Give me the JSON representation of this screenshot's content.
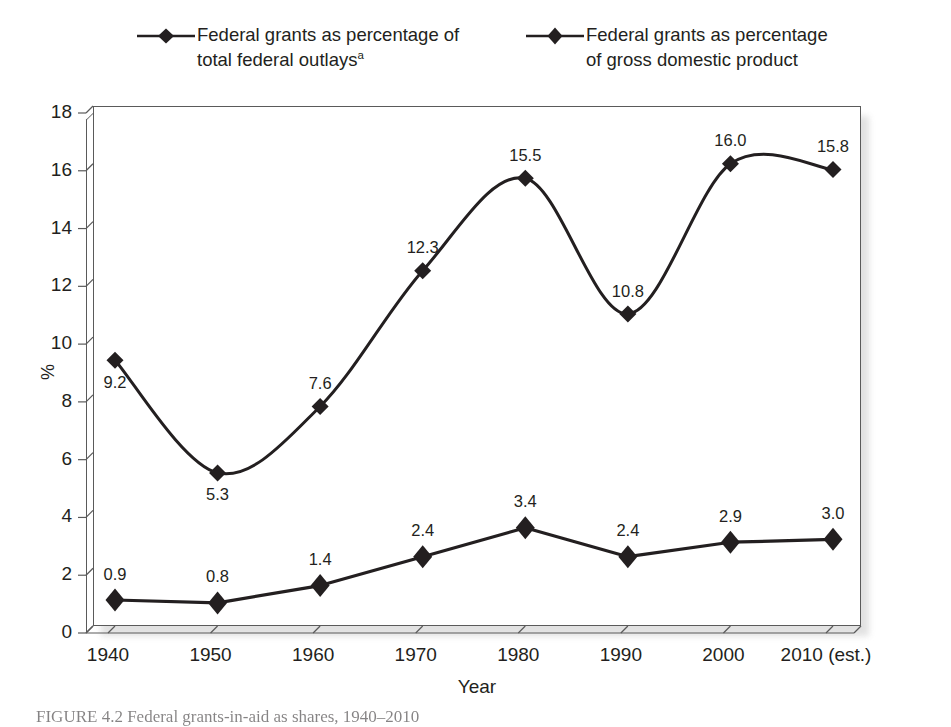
{
  "legend": {
    "entries": [
      {
        "label": "Federal grants as percentage of\ntotal federal outlays",
        "note": "a",
        "marker": "diamond-marker-icon"
      },
      {
        "label": "Federal grants as percentage\nof gross domestic product",
        "note": "",
        "marker": "diamond-marker-icon"
      }
    ]
  },
  "caption": {
    "text": "FIGURE 4.2   Federal grants-in-aid as shares, 1940–2010"
  },
  "chart_data": {
    "type": "line",
    "title": "",
    "xlabel": "Year",
    "ylabel": "%",
    "categories": [
      "1940",
      "1950",
      "1960",
      "1970",
      "1980",
      "1990",
      "2000",
      "2010 (est.)"
    ],
    "x_values": [
      1940,
      1950,
      1960,
      1970,
      1980,
      1990,
      2000,
      2010
    ],
    "ylim": [
      0,
      18
    ],
    "yticks": [
      "0",
      "2",
      "4",
      "6",
      "8",
      "10",
      "12",
      "14",
      "16",
      "18"
    ],
    "ytick_values": [
      0,
      2,
      4,
      6,
      8,
      10,
      12,
      14,
      16,
      18
    ],
    "grid": false,
    "legend_position": "top",
    "marker": "diamond",
    "line_color": "#231f20",
    "series": [
      {
        "name": "Federal grants as percentage of total federal outlays",
        "values": [
          9.2,
          5.3,
          7.6,
          12.3,
          15.5,
          10.8,
          16.0,
          15.8
        ],
        "labels": [
          "9.2",
          "5.3",
          "7.6",
          "12.3",
          "15.5",
          "10.8",
          "16.0",
          "15.8"
        ],
        "label_positions": [
          "below",
          "below",
          "above",
          "above",
          "above",
          "above",
          "above",
          "above"
        ],
        "smooth": true
      },
      {
        "name": "Federal grants as percentage of gross domestic product",
        "values": [
          0.9,
          0.8,
          1.4,
          2.4,
          3.4,
          2.4,
          2.9,
          3.0
        ],
        "labels": [
          "0.9",
          "0.8",
          "1.4",
          "2.4",
          "3.4",
          "2.4",
          "2.9",
          "3.0"
        ],
        "label_positions": [
          "above",
          "above",
          "above",
          "above",
          "above",
          "above",
          "above",
          "above"
        ],
        "smooth": false
      }
    ]
  }
}
